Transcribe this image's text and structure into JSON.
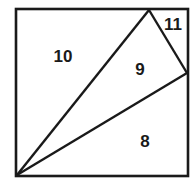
{
  "figure": {
    "type": "square-partitioned-into-triangles",
    "stroke_color": "#1a1a1a",
    "background": "#ffffff",
    "square": {
      "x1": 16,
      "y1": 9,
      "x2": 188,
      "y2": 176
    },
    "vertices": {
      "bottom_left": [
        17,
        175
      ],
      "top_point": [
        149,
        10
      ],
      "right_point": [
        187,
        73
      ]
    },
    "regions": [
      {
        "id": "region-10",
        "label": "10",
        "x": 63,
        "y": 62
      },
      {
        "id": "region-9",
        "label": "9",
        "x": 140,
        "y": 75
      },
      {
        "id": "region-11",
        "label": "11",
        "x": 173,
        "y": 30
      },
      {
        "id": "region-8",
        "label": "8",
        "x": 145,
        "y": 147
      }
    ]
  }
}
